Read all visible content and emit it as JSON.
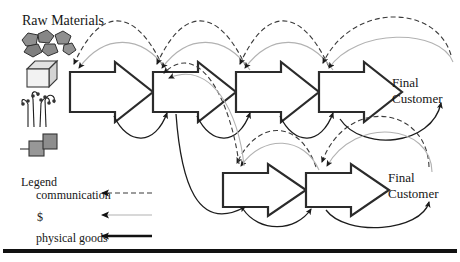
{
  "raw_materials_label": "Raw Materials",
  "upper_chain": {
    "stages": 4,
    "final_customer": {
      "line1": "Final",
      "line2": "Customer"
    }
  },
  "lower_chain": {
    "stages": 2,
    "final_customer": {
      "line1": "Final",
      "line2": "Customer"
    }
  },
  "legend": {
    "title": "Legend",
    "items": [
      {
        "name": "communication",
        "label": "communication",
        "style": "dashed"
      },
      {
        "name": "money",
        "label": "$",
        "style": "solid-thin"
      },
      {
        "name": "physical-goods",
        "label": "physical goods",
        "style": "solid-thick"
      }
    ]
  },
  "icons": [
    "rocks-icon",
    "box-icon",
    "plants-icon",
    "squares-icon"
  ],
  "colors": {
    "communication": "#3a3a3a",
    "money": "#b2b2b2",
    "physical_goods": "#1c1c1c",
    "arrow_outline": "#2b2b2b",
    "arrow_fill": "#ffffff",
    "rock_fill": "#8f8f8f",
    "square_fill": "#979797",
    "bottom_bar": "#111111"
  }
}
